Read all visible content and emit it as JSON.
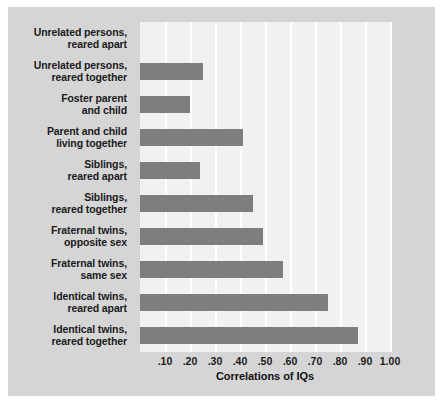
{
  "chart_data": {
    "type": "bar",
    "orientation": "horizontal",
    "title": "",
    "xlabel": "Correlations of IQs",
    "ylabel": "",
    "xlim": [
      0,
      1.0
    ],
    "grid": true,
    "legend": false,
    "tick_labels": [
      ".10",
      ".20",
      ".30",
      ".40",
      ".50",
      ".60",
      ".70",
      ".80",
      ".90",
      "1.00"
    ],
    "tick_values": [
      0.1,
      0.2,
      0.3,
      0.4,
      0.5,
      0.6,
      0.7,
      0.8,
      0.9,
      1.0
    ],
    "categories": [
      "Unrelated persons, reared apart",
      "Unrelated persons, reared together",
      "Foster parent and child",
      "Parent and child living together",
      "Siblings, reared apart",
      "Siblings, reared together",
      "Fraternal twins, opposite sex",
      "Fraternal twins, same sex",
      "Identical twins, reared apart",
      "Identical twins, reared together"
    ],
    "category_lines": [
      [
        "Unrelated persons,",
        "reared apart"
      ],
      [
        "Unrelated persons,",
        "reared together"
      ],
      [
        "Foster parent",
        "and child"
      ],
      [
        "Parent and child",
        "living together"
      ],
      [
        "Siblings,",
        "reared apart"
      ],
      [
        "Siblings,",
        "reared together"
      ],
      [
        "Fraternal twins,",
        "opposite sex"
      ],
      [
        "Fraternal twins,",
        "same sex"
      ],
      [
        "Identical twins,",
        "reared apart"
      ],
      [
        "Identical twins,",
        "reared together"
      ]
    ],
    "values": [
      0.0,
      0.25,
      0.2,
      0.41,
      0.24,
      0.45,
      0.49,
      0.57,
      0.75,
      0.87
    ],
    "bar_color": "#7e7e7e",
    "plot_background": "#f1f1f1",
    "figure_background": "#d5d5d5",
    "gridline_color": "#ffffff"
  }
}
